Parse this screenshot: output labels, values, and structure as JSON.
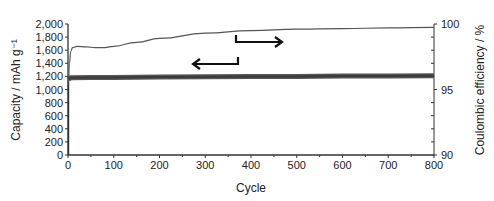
{
  "chart_data": {
    "type": "line",
    "title": "",
    "xlabel": "Cycle",
    "ylabel": "Capacity / mAh g⁻¹",
    "y2label": "Coulombic efficiency / %",
    "xlim": [
      0,
      800
    ],
    "ylim": [
      0,
      2000
    ],
    "y2lim": [
      90,
      100
    ],
    "x_ticks": [
      "0",
      "100",
      "200",
      "300",
      "400",
      "500",
      "600",
      "700",
      "800"
    ],
    "y_ticks": [
      "0",
      "200",
      "400",
      "600",
      "800",
      "1,000",
      "1,200",
      "1,400",
      "1,600",
      "1,800",
      "2,000"
    ],
    "y2_ticks": [
      "90",
      "95",
      "100"
    ],
    "grid": false,
    "legend": "none; arrows indicate axis association (left arrow → capacity, right arrow → coulombic efficiency)",
    "series": [
      {
        "name": "Capacity",
        "axis": "left",
        "style": "thick dark band",
        "x": [
          1,
          5,
          50,
          100,
          200,
          300,
          400,
          500,
          600,
          700,
          800
        ],
        "values": [
          1150,
          1180,
          1185,
          1185,
          1190,
          1195,
          1200,
          1200,
          1205,
          1205,
          1210
        ]
      },
      {
        "name": "Coulombic efficiency",
        "axis": "right",
        "style": "thin line",
        "x": [
          1,
          3,
          6,
          10,
          20,
          40,
          60,
          80,
          100,
          150,
          200,
          300,
          400,
          500,
          600,
          700,
          800
        ],
        "values": [
          95.5,
          97.0,
          97.9,
          98.2,
          98.3,
          98.25,
          98.2,
          98.2,
          98.3,
          98.6,
          98.9,
          99.3,
          99.5,
          99.6,
          99.65,
          99.7,
          99.75
        ]
      }
    ],
    "annotations": [
      {
        "type": "arrow",
        "direction": "left",
        "meaning": "capacity uses left axis"
      },
      {
        "type": "arrow",
        "direction": "right",
        "meaning": "coulombic efficiency uses right axis"
      }
    ]
  }
}
